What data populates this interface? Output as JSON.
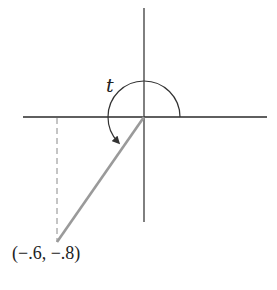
{
  "diagram": {
    "type": "unit-circle-angle",
    "angle_label": "t",
    "point_label": "(−.6, −.8)",
    "point": {
      "x": -0.6,
      "y": -0.8
    },
    "colors": {
      "axes": "#2a2a2a",
      "terminal_side": "#9a9a9a",
      "dashed_projection": "#8a8a8a",
      "arc": "#333333",
      "text": "#222222",
      "background": "#ffffff"
    }
  }
}
